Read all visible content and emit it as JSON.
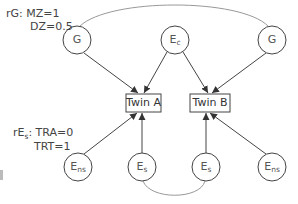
{
  "diagram": {
    "type": "twin-model-path-diagram",
    "annotations": {
      "rG_label": "rG: MZ=1",
      "rG_dz": "DZ=0.5",
      "rEs_prefix": "rE",
      "rEs_sub": "s",
      "rEs_tra": ": TRA=0",
      "rEs_trt": "TRT=1"
    },
    "nodes": {
      "g_left": {
        "label": "G"
      },
      "ec": {
        "label": "E",
        "sub": "c"
      },
      "g_right": {
        "label": "G"
      },
      "twin_a": {
        "label": "Twin A"
      },
      "twin_b": {
        "label": "Twin B"
      },
      "ens_left": {
        "label": "E",
        "sub": "ns"
      },
      "es_left": {
        "label": "E",
        "sub": "s"
      },
      "es_right": {
        "label": "E",
        "sub": "s"
      },
      "ens_right": {
        "label": "E",
        "sub": "ns"
      }
    },
    "edges": [
      {
        "from": "g_left",
        "to": "twin_a",
        "type": "arrow"
      },
      {
        "from": "ec",
        "to": "twin_a",
        "type": "arrow"
      },
      {
        "from": "ec",
        "to": "twin_b",
        "type": "arrow"
      },
      {
        "from": "g_right",
        "to": "twin_b",
        "type": "arrow"
      },
      {
        "from": "ens_left",
        "to": "twin_a",
        "type": "arrow"
      },
      {
        "from": "es_left",
        "to": "twin_a",
        "type": "arrow"
      },
      {
        "from": "es_right",
        "to": "twin_b",
        "type": "arrow"
      },
      {
        "from": "ens_right",
        "to": "twin_b",
        "type": "arrow"
      },
      {
        "from": "g_left",
        "to": "g_right",
        "type": "correlation-curve"
      },
      {
        "from": "es_left",
        "to": "es_right",
        "type": "correlation-curve"
      }
    ],
    "colors": {
      "stroke": "#444444",
      "curve": "#999999",
      "text": "#444444"
    }
  }
}
